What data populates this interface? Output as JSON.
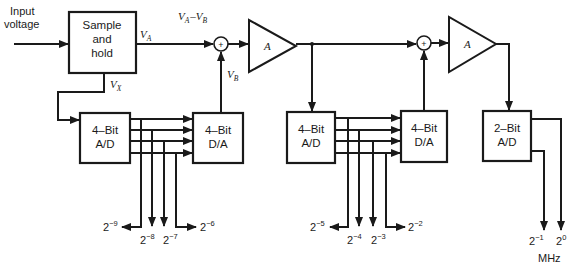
{
  "diagram": {
    "type": "block-diagram",
    "colors": {
      "ink": "#1a1a1a",
      "background": "#ffffff"
    },
    "input": {
      "label_line1": "Input",
      "label_line2": "voltage"
    },
    "blocks": {
      "sample_hold": {
        "line1": "Sample",
        "line2": "and",
        "line3": "hold"
      },
      "adc1": {
        "line1": "4–Bit",
        "line2": "A/D"
      },
      "dac1": {
        "line1": "4–Bit",
        "line2": "D/A"
      },
      "adc2": {
        "line1": "4–Bit",
        "line2": "A/D"
      },
      "dac2": {
        "line1": "4–Bit",
        "line2": "D/A"
      },
      "adc3": {
        "line1": "2–Bit",
        "line2": "A/D"
      },
      "amp1": {
        "label": "A"
      },
      "amp2": {
        "label": "A"
      },
      "sum1": {
        "symbol": "+"
      },
      "sum2": {
        "symbol": "+"
      }
    },
    "signals": {
      "va": {
        "base": "V",
        "sub": "A"
      },
      "vx": {
        "base": "V",
        "sub": "X"
      },
      "vb": {
        "base": "V",
        "sub": "B"
      },
      "diff": {
        "a_base": "V",
        "a_sub": "A",
        "minus": "–",
        "b_base": "V",
        "b_sub": "B"
      }
    },
    "outputs": {
      "stage1": [
        {
          "base": "2",
          "exp": "−9"
        },
        {
          "base": "2",
          "exp": "−8"
        },
        {
          "base": "2",
          "exp": "−7"
        },
        {
          "base": "2",
          "exp": "−6"
        }
      ],
      "stage2": [
        {
          "base": "2",
          "exp": "−5"
        },
        {
          "base": "2",
          "exp": "−4"
        },
        {
          "base": "2",
          "exp": "−3"
        },
        {
          "base": "2",
          "exp": "−2"
        }
      ],
      "stage3": [
        {
          "base": "2",
          "exp": "−1"
        },
        {
          "base": "2",
          "exp": "0"
        }
      ],
      "msb_note": "MHz"
    }
  }
}
